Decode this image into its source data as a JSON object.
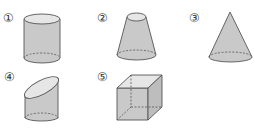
{
  "figure": {
    "items": [
      {
        "number": "1",
        "label": "①",
        "shape": "cylinder"
      },
      {
        "number": "2",
        "label": "②",
        "shape": "frustum"
      },
      {
        "number": "3",
        "label": "③",
        "shape": "cone"
      },
      {
        "number": "4",
        "label": "④",
        "shape": "oblique-cut-cylinder"
      },
      {
        "number": "5",
        "label": "⑤",
        "shape": "cube"
      }
    ],
    "colors": {
      "fill": "#c9c9c9",
      "top_face": "#e6e6e6",
      "stroke": "#555555"
    }
  }
}
